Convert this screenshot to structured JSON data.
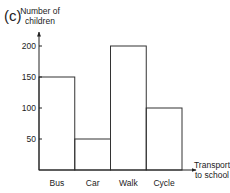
{
  "panel_label": "(c)",
  "chart_data": {
    "type": "bar",
    "title": "",
    "categories": [
      "Bus",
      "Car",
      "Walk",
      "Cycle"
    ],
    "values": [
      150,
      50,
      200,
      100
    ],
    "xlabel": "Transport to school",
    "xlabel_lines": [
      "Transport",
      "to school"
    ],
    "ylabel": "Number of children",
    "ylabel_lines": [
      "Number of",
      "children"
    ],
    "yticks": [
      50,
      100,
      150,
      200
    ],
    "ylim": [
      0,
      200
    ],
    "grid": false,
    "legend": null,
    "bar_style": "unfilled outlined bars, touching"
  }
}
